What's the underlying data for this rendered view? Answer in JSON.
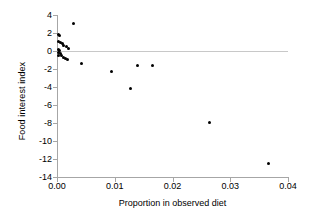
{
  "chart_data": {
    "type": "scatter",
    "title": "",
    "xlabel": "Proportion in observed diet",
    "ylabel": "Food interest index",
    "xlim": [
      0.0,
      0.04
    ],
    "ylim": [
      -14,
      4
    ],
    "xticks": [
      "0.00",
      "0.01",
      "0.02",
      "0.03",
      "0.04"
    ],
    "xtick_values": [
      0.0,
      0.01,
      0.02,
      0.03,
      0.04
    ],
    "yticks": [
      "4",
      "2",
      "0",
      "-2",
      "-4",
      "-6",
      "-8",
      "-10",
      "-12",
      "-14"
    ],
    "ytick_values": [
      4,
      2,
      0,
      -2,
      -4,
      -6,
      -8,
      -10,
      -12,
      -14
    ],
    "grid": false,
    "legend": null,
    "marker": "filled-circle",
    "marker_color": "#000000",
    "axis_color": "#a6a6a6",
    "zero_reference_line": {
      "y": 0,
      "color": "#c8c8c8",
      "x_from": 0.0,
      "x_to": 0.04
    },
    "points": [
      {
        "x": 0.00028,
        "y": 1.85
      },
      {
        "x": 0.00048,
        "y": 1.7
      },
      {
        "x": 0.0003,
        "y": 1.05
      },
      {
        "x": 0.0006,
        "y": 0.95
      },
      {
        "x": 0.0009,
        "y": 0.82
      },
      {
        "x": 0.0012,
        "y": 0.62
      },
      {
        "x": 0.00165,
        "y": 0.48
      },
      {
        "x": 0.00205,
        "y": 0.3
      },
      {
        "x": 0.00022,
        "y": 0.22
      },
      {
        "x": 0.0004,
        "y": 0.05
      },
      {
        "x": 0.00025,
        "y": -0.15
      },
      {
        "x": 0.00058,
        "y": -0.28
      },
      {
        "x": 0.0003,
        "y": -0.45
      },
      {
        "x": 0.00085,
        "y": -0.52
      },
      {
        "x": 0.00115,
        "y": -0.68
      },
      {
        "x": 0.0015,
        "y": -0.8
      },
      {
        "x": 0.00185,
        "y": -0.92
      },
      {
        "x": 0.0028,
        "y": 3.08
      },
      {
        "x": 0.0042,
        "y": -1.35
      },
      {
        "x": 0.0095,
        "y": -2.3
      },
      {
        "x": 0.0127,
        "y": -4.22
      },
      {
        "x": 0.0139,
        "y": -1.62
      },
      {
        "x": 0.0165,
        "y": -1.62
      },
      {
        "x": 0.0264,
        "y": -7.95
      },
      {
        "x": 0.0366,
        "y": -12.55
      }
    ]
  }
}
